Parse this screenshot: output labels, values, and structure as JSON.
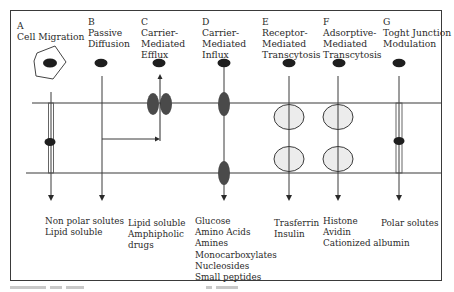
{
  "diagram": {
    "mechanisms": [
      {
        "letter": "A",
        "title_lines": [
          "Cell Migration"
        ],
        "solutes": [
          "Non polar solutes",
          "Lipid soluble"
        ]
      },
      {
        "letter": "B",
        "title_lines": [
          "Passive",
          "Diffusion"
        ],
        "solutes": []
      },
      {
        "letter": "C",
        "title_lines": [
          "Carrier-",
          "Mediated",
          "Efflux"
        ],
        "solutes": [
          "Lipid soluble",
          "Amphipholic",
          "drugs"
        ]
      },
      {
        "letter": "D",
        "title_lines": [
          "Carrier-",
          "Mediated",
          "Influx"
        ],
        "solutes": [
          "Glucose",
          "Amino Acids",
          "Amines",
          "Monocarboxylates",
          "Nucleosides",
          "Small peptides"
        ]
      },
      {
        "letter": "E",
        "title_lines": [
          "Receptor-",
          "Mediated",
          "Transcytosis"
        ],
        "solutes": [
          "Trasferrin",
          "Insulin"
        ]
      },
      {
        "letter": "F",
        "title_lines": [
          "Adsorptive-",
          "Mediated",
          "Transcytosis"
        ],
        "solutes": [
          "Histone",
          "Avidin",
          "Cationized albumin"
        ]
      },
      {
        "letter": "G",
        "title_lines": [
          "Toght Junction",
          "Modulation"
        ],
        "solutes": [
          "Polar solutes"
        ]
      }
    ],
    "colors": {
      "line": "#3a3a3a",
      "molecule": "#1e1e1e",
      "carrier": "#4a4a4a",
      "vesicle_fill": "#ececec",
      "background": "#ffffff"
    },
    "icons": {
      "cell": "hexagon-cell-icon",
      "molecule": "ellipse-molecule-icon",
      "carrier": "carrier-protein-icon",
      "vesicle": "vesicle-icon",
      "arrow": "arrow-down-icon"
    }
  }
}
